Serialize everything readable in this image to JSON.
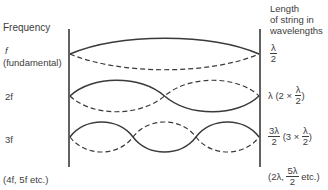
{
  "headers": {
    "left": "Frequency",
    "right_line1": "Length",
    "right_line2": "of string in",
    "right_line3": "wavelengths"
  },
  "rows": [
    {
      "frequency": "f",
      "frequency_note": "(fundamental)",
      "length_num": "λ",
      "length_den": "2",
      "harmonic": 1
    },
    {
      "frequency": "2f",
      "length_prefix": "λ (2 ×",
      "length_num": "λ",
      "length_den": "2",
      "length_suffix": ")",
      "harmonic": 2
    },
    {
      "frequency": "3f",
      "length_num": "3λ",
      "length_den": "2",
      "length_mid": "(3 ×",
      "length_num2": "λ",
      "length_den2": "2",
      "length_suffix": ")",
      "harmonic": 3
    }
  ],
  "footer": {
    "frequency": "(4f, 5f  etc.)",
    "length_prefix": "(2λ,",
    "length_num": "5λ",
    "length_den": "2",
    "length_suffix": "etc.)"
  },
  "colors": {
    "line": "#3a3a3a",
    "text": "#3d3d3d",
    "background": "#ffffff"
  }
}
